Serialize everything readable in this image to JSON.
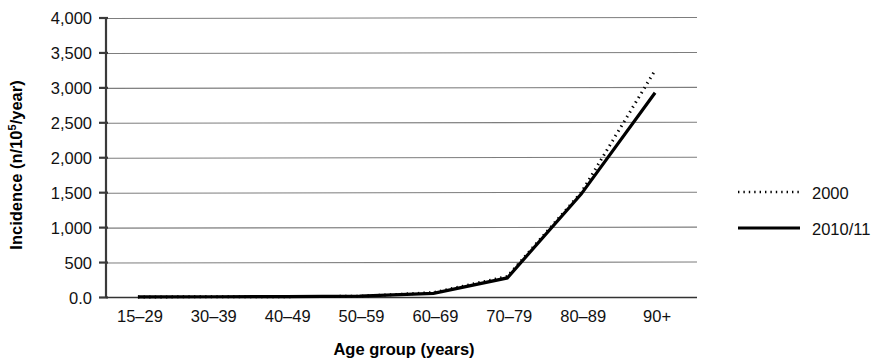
{
  "chart_data": {
    "type": "line",
    "title": "",
    "xlabel": "Age group (years)",
    "ylabel": "Incidence (n/10⁵/year)",
    "ylabel_main": "Incidence (n/10",
    "ylabel_sup": "5",
    "ylabel_tail": "/year)",
    "categories": [
      "15–29",
      "30–39",
      "40–49",
      "50–59",
      "60–69",
      "70–79",
      "80–89",
      "90+"
    ],
    "ytick_labels": [
      "0.0",
      "500",
      "1,000",
      "1,500",
      "2,000",
      "2,500",
      "3,000",
      "3,500",
      "4,000"
    ],
    "ytick_values": [
      0,
      500,
      1000,
      1500,
      2000,
      2500,
      3000,
      3500,
      4000
    ],
    "ylim": [
      0,
      4000
    ],
    "grid": true,
    "legend_position": "right",
    "series": [
      {
        "name": "2000",
        "style": "dotted",
        "color": "#000000",
        "values": [
          8,
          10,
          12,
          18,
          70,
          300,
          1500,
          3250
        ]
      },
      {
        "name": "2010/11",
        "style": "solid",
        "color": "#000000",
        "values": [
          10,
          11,
          13,
          20,
          60,
          280,
          1480,
          2930
        ]
      }
    ]
  },
  "legend": {
    "items": [
      {
        "label": "2000",
        "style": "dotted"
      },
      {
        "label": "2010/11",
        "style": "solid"
      }
    ]
  },
  "colors": {
    "line": "#000000",
    "grid": "#7d7d7d",
    "axis": "#3a3a3a",
    "background": "#ffffff"
  }
}
